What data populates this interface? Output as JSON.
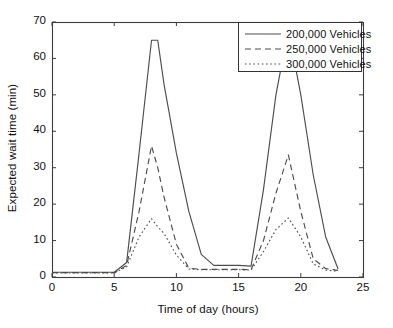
{
  "chart_data": {
    "type": "line",
    "title": "",
    "subtitle": "",
    "xlabel": "Time of day (hours)",
    "ylabel": "Expected wait time (min)",
    "xlim": [
      0,
      25
    ],
    "ylim": [
      0,
      70
    ],
    "xticks": [
      0,
      5,
      10,
      15,
      20,
      25
    ],
    "yticks": [
      0,
      10,
      20,
      30,
      40,
      50,
      60,
      70
    ],
    "grid": false,
    "legend_position": "top-right",
    "x": [
      0,
      1,
      2,
      3,
      4,
      5,
      6,
      7,
      8,
      8.5,
      9,
      10,
      11,
      12,
      13,
      14,
      15,
      16,
      17,
      18,
      19,
      20,
      21,
      22,
      23
    ],
    "series": [
      {
        "name": "200,000 Vehicles",
        "style": "solid",
        "color": "#4d4d4d",
        "values": [
          1.3,
          1.3,
          1.3,
          1.3,
          1.3,
          1.3,
          4.0,
          34.0,
          65.0,
          65.0,
          53.0,
          34.0,
          18.0,
          6.2,
          3.2,
          3.2,
          3.2,
          3.0,
          24.0,
          50.0,
          68.0,
          50.0,
          28.0,
          11.0,
          2.2
        ]
      },
      {
        "name": "250,000 Vehicles",
        "style": "dashed",
        "color": "#4d4d4d",
        "values": [
          1.2,
          1.2,
          1.2,
          1.2,
          1.2,
          1.2,
          3.2,
          18.0,
          36.0,
          30.0,
          22.0,
          9.0,
          2.4,
          2.1,
          2.1,
          2.1,
          2.1,
          2.0,
          10.0,
          23.0,
          33.5,
          18.0,
          5.0,
          2.3,
          1.8
        ]
      },
      {
        "name": "300,000 Vehicles",
        "style": "dotted",
        "color": "#4d4d4d",
        "values": [
          1.1,
          1.1,
          1.1,
          1.1,
          1.1,
          1.1,
          2.8,
          11.0,
          16.0,
          13.8,
          12.0,
          6.0,
          2.2,
          2.0,
          2.0,
          2.0,
          2.0,
          1.9,
          7.0,
          13.0,
          16.2,
          11.0,
          3.6,
          1.9,
          1.6
        ]
      }
    ]
  },
  "legend": {
    "items": [
      {
        "label": "200,000 Vehicles",
        "style": "solid"
      },
      {
        "label": "250,000 Vehicles",
        "style": "dashed"
      },
      {
        "label": "300,000 Vehicles",
        "style": "dotted"
      }
    ]
  },
  "axes": {
    "xtick_labels": [
      "0",
      "5",
      "10",
      "15",
      "20",
      "25"
    ],
    "ytick_labels": [
      "0",
      "10",
      "20",
      "30",
      "40",
      "50",
      "60",
      "70"
    ]
  }
}
